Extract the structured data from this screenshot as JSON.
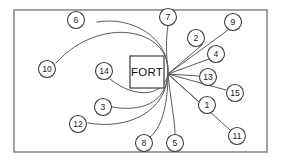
{
  "figure": {
    "name": "fort-route-diagram",
    "width": 281,
    "height": 164,
    "background_color": "#ffffff",
    "frame": {
      "name": "outer-border",
      "x": 14,
      "y": 10,
      "width": 253,
      "height": 142,
      "stroke_color": "#8a8a8a"
    },
    "center_box": {
      "name": "fort-box",
      "label": "FORT",
      "x": 130,
      "y": 56,
      "width": 34,
      "height": 32,
      "stroke_color": "#4a4a4a"
    },
    "convergence_point": {
      "x": 168,
      "y": 74
    },
    "line_color": "#5a5a5a",
    "node_stroke_color": "#3d3d3d"
  },
  "nodes": [
    {
      "id": "1",
      "label": "1",
      "cx": 207,
      "cy": 105,
      "r": 8.5
    },
    {
      "id": "2",
      "label": "2",
      "cx": 196,
      "cy": 38,
      "r": 8.5
    },
    {
      "id": "3",
      "label": "3",
      "cx": 103,
      "cy": 107,
      "r": 8.5
    },
    {
      "id": "4",
      "label": "4",
      "cx": 216,
      "cy": 54,
      "r": 8.5
    },
    {
      "id": "5",
      "label": "5",
      "cx": 175,
      "cy": 143,
      "r": 8.5
    },
    {
      "id": "6",
      "label": "6",
      "cx": 76,
      "cy": 20,
      "r": 8.5
    },
    {
      "id": "7",
      "label": "7",
      "cx": 168,
      "cy": 17,
      "r": 8.5
    },
    {
      "id": "8",
      "label": "8",
      "cx": 144,
      "cy": 143,
      "r": 8.5
    },
    {
      "id": "9",
      "label": "9",
      "cx": 233,
      "cy": 22,
      "r": 8.5
    },
    {
      "id": "10",
      "label": "10",
      "cx": 47,
      "cy": 69,
      "r": 8.5
    },
    {
      "id": "11",
      "label": "11",
      "cx": 237,
      "cy": 136,
      "r": 8.5
    },
    {
      "id": "12",
      "label": "12",
      "cx": 78,
      "cy": 124,
      "r": 8.5
    },
    {
      "id": "13",
      "label": "13",
      "cx": 208,
      "cy": 77,
      "r": 8.5
    },
    {
      "id": "14",
      "label": "14",
      "cx": 104,
      "cy": 71,
      "r": 8.5
    },
    {
      "id": "15",
      "label": "15",
      "cx": 235,
      "cy": 93,
      "r": 8.5
    }
  ],
  "routes": [
    {
      "node": "1",
      "type": "line",
      "d": "M 168 74 L 199 102"
    },
    {
      "node": "2",
      "type": "line",
      "d": "M 168 74 L 202 45"
    },
    {
      "node": "3",
      "type": "curve",
      "d": "M 168 74 C 166 104, 140 112, 112 107"
    },
    {
      "node": "4",
      "type": "line",
      "d": "M 168 74 L 209 59"
    },
    {
      "node": "5",
      "type": "curve",
      "d": "M 168 74 C 171 104, 175 120, 175 134"
    },
    {
      "node": "6",
      "type": "curve",
      "d": "M 168 74 C 170 36, 130 16, 97 22"
    },
    {
      "node": "7",
      "type": "curve",
      "d": "M 168 74 C 166 52, 166 38, 168 26"
    },
    {
      "node": "8",
      "type": "curve",
      "d": "M 168 74 C 168 108, 160 130, 150 137"
    },
    {
      "node": "9",
      "type": "line",
      "d": "M 168 74 L 228 30"
    },
    {
      "node": "10",
      "type": "curve",
      "d": "M 168 74 C 172 28, 100 14, 56 63"
    },
    {
      "node": "11",
      "type": "line",
      "d": "M 168 74 L 230 130"
    },
    {
      "node": "12",
      "type": "curve",
      "d": "M 168 74 C 166 112, 128 130, 88 123"
    },
    {
      "node": "13",
      "type": "line",
      "d": "M 168 74 L 199 76"
    },
    {
      "node": "14",
      "type": "curve",
      "d": "M 168 74 C 164 96, 136 100, 110 79"
    },
    {
      "node": "15",
      "type": "line",
      "d": "M 168 74 L 226 90"
    }
  ]
}
